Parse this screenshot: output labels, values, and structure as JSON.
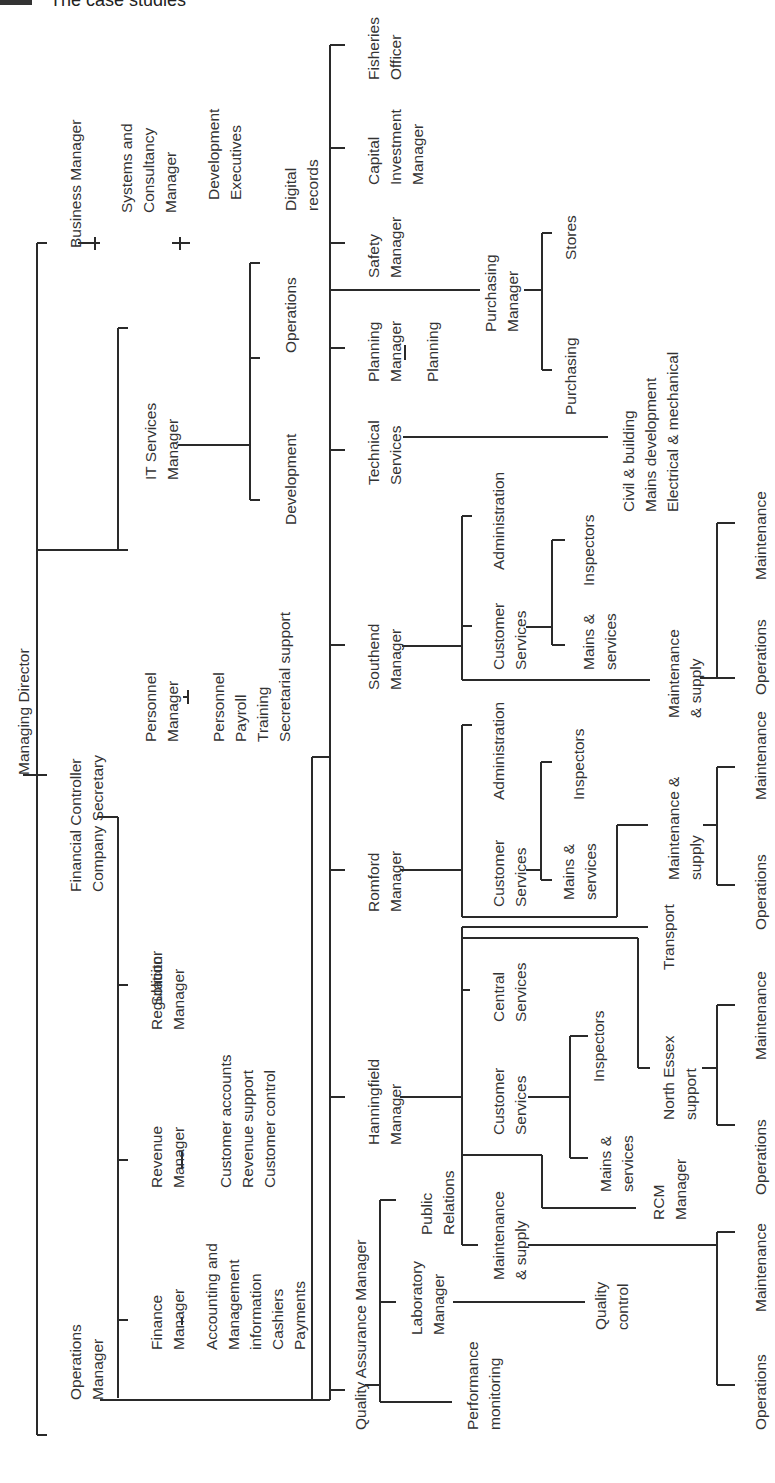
{
  "header": {
    "title": "The case studies"
  },
  "chart": {
    "orientation": "rotated-90-ccw",
    "root": "Managing Director",
    "nodes": {
      "md": [
        "Managing Director"
      ],
      "bm": [
        "Business Manager"
      ],
      "scm": [
        "Systems and",
        "Consultancy",
        "Manager"
      ],
      "de": [
        "Development",
        "Executives"
      ],
      "itm": [
        "IT Services",
        "Manager"
      ],
      "it_dev": [
        "Development"
      ],
      "it_ops": [
        "Operations"
      ],
      "it_dig": [
        "Digital",
        "records"
      ],
      "pm": [
        "Personnel",
        "Manager"
      ],
      "pm_sub": [
        "Personnel",
        "Payroll",
        "Training",
        "Secretarial support"
      ],
      "fc": [
        "Financial Controller",
        "Company Secretary"
      ],
      "sol": [
        "Solicitor"
      ],
      "reg": [
        "Regulation",
        "Manager"
      ],
      "rev": [
        "Revenue",
        "Manager"
      ],
      "rev_sub": [
        "Customer accounts",
        "Revenue support",
        "Customer control"
      ],
      "fin": [
        "Finance",
        "Manager"
      ],
      "fin_sub": [
        "Accounting and",
        "Management",
        "information",
        "Cashiers",
        "Payments"
      ],
      "om": [
        "Operations",
        "Manager"
      ],
      "fish": [
        "Fisheries",
        "Officer"
      ],
      "cap": [
        "Capital",
        "Investment",
        "Manager"
      ],
      "safe": [
        "Safety",
        "Manager"
      ],
      "purch": [
        "Purchasing",
        "Manager"
      ],
      "stores": [
        "Stores"
      ],
      "purchasing": [
        "Purchasing"
      ],
      "plan": [
        "Planning",
        "Manager"
      ],
      "planning": [
        "Planning"
      ],
      "tech": [
        "Technical",
        "Services"
      ],
      "tech_sub": [
        "Civil & building",
        "Mains development",
        "Electrical & mechanical"
      ],
      "south": [
        "Southend",
        "Manager"
      ],
      "s_admin": [
        "Administration"
      ],
      "s_cs": [
        "Customer",
        "Services"
      ],
      "s_insp": [
        "Inspectors"
      ],
      "s_mains": [
        "Mains &",
        "services"
      ],
      "s_ms": [
        "Maintenance",
        "& supply"
      ],
      "s_maint": [
        "Maintenance"
      ],
      "s_ops": [
        "Operations"
      ],
      "rom": [
        "Romford",
        "Manager"
      ],
      "r_admin": [
        "Administration"
      ],
      "r_cs": [
        "Customer",
        "Services"
      ],
      "r_insp": [
        "Inspectors"
      ],
      "r_mains": [
        "Mains &",
        "services"
      ],
      "r_ms": [
        "Maintenance &",
        "supply"
      ],
      "r_maint": [
        "Maintenance"
      ],
      "r_ops": [
        "Operations"
      ],
      "han": [
        "Hanningfield",
        "Manager"
      ],
      "transport": [
        "Transport"
      ],
      "h_central": [
        "Central",
        "Services"
      ],
      "h_cs": [
        "Customer",
        "Services"
      ],
      "h_insp": [
        "Inspectors"
      ],
      "h_mains": [
        "Mains &",
        "services"
      ],
      "ne": [
        "North Essex",
        "support"
      ],
      "ne_maint": [
        "Maintenance"
      ],
      "ne_ops": [
        "Operations"
      ],
      "rcm": [
        "RCM",
        "Manager"
      ],
      "h_ms": [
        "Maintenance",
        "& supply"
      ],
      "h_maint": [
        "Maintenance"
      ],
      "h_ops": [
        "Operations"
      ],
      "qa": [
        "Quality Assurance Manager"
      ],
      "pr": [
        "Public",
        "Relations"
      ],
      "lab": [
        "Laboratory",
        "Manager"
      ],
      "qc": [
        "Quality",
        "control"
      ],
      "perf": [
        "Performance",
        "monitoring"
      ]
    }
  }
}
